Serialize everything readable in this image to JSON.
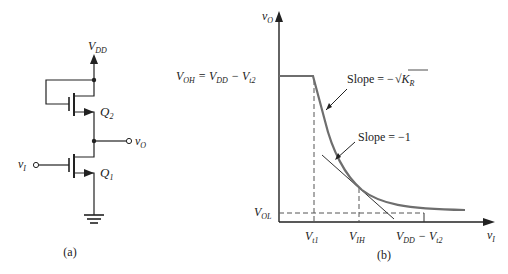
{
  "circuit": {
    "caption": "(a)",
    "supply_label": "V",
    "supply_sub": "DD",
    "transistor_top": {
      "label": "Q",
      "sub": "2"
    },
    "transistor_bottom": {
      "label": "Q",
      "sub": "1"
    },
    "input": {
      "label": "v",
      "sub": "I"
    },
    "output": {
      "label": "v",
      "sub": "O"
    }
  },
  "graph": {
    "caption": "(b)",
    "y_axis": {
      "label": "v",
      "sub": "O"
    },
    "x_axis": {
      "label": "v",
      "sub": "I"
    },
    "voh_label": {
      "text1": "V",
      "sub1": "OH",
      "text2": " = V",
      "sub2": "DD",
      "text3": " −  V",
      "sub3": "t2"
    },
    "vol_label": {
      "text": "V",
      "sub": "OL"
    },
    "x_ticks": [
      {
        "text": "V",
        "sub": "t1"
      },
      {
        "text": "V",
        "sub": "IH"
      },
      {
        "text": "V",
        "sub": "DD",
        "text2": " − V",
        "sub2": "t2"
      }
    ],
    "annotation_1": {
      "text": "Slope = −",
      "radicand": "K",
      "radicand_sub": "R"
    },
    "annotation_2": {
      "text": "Slope = −1"
    },
    "curve_color": "#6e6e6e",
    "line_color": "#333333"
  }
}
